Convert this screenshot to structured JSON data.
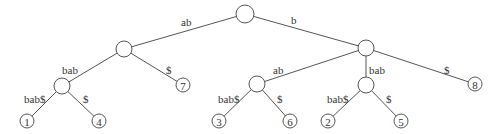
{
  "diagram": {
    "type": "suffix-tree",
    "colors": {
      "stroke": "#555555",
      "text": "#333333",
      "background": "#ffffff"
    },
    "nodes": [
      {
        "id": "root",
        "x": 245,
        "y": 14,
        "r": 9,
        "label": ""
      },
      {
        "id": "n_ab",
        "x": 124,
        "y": 49,
        "r": 8,
        "label": ""
      },
      {
        "id": "n_b",
        "x": 366,
        "y": 48,
        "r": 8,
        "label": ""
      },
      {
        "id": "n_abbab",
        "x": 62,
        "y": 86,
        "r": 8,
        "label": ""
      },
      {
        "id": "leaf7",
        "x": 183,
        "y": 85,
        "r": 7,
        "label": "7"
      },
      {
        "id": "n_bab",
        "x": 257,
        "y": 84,
        "r": 8,
        "label": ""
      },
      {
        "id": "n_bbab",
        "x": 366,
        "y": 85,
        "r": 8,
        "label": ""
      },
      {
        "id": "leaf8",
        "x": 475,
        "y": 84,
        "r": 7,
        "label": "8"
      },
      {
        "id": "leaf1",
        "x": 27,
        "y": 121,
        "r": 7,
        "label": "1"
      },
      {
        "id": "leaf4",
        "x": 99,
        "y": 121,
        "r": 7,
        "label": "4"
      },
      {
        "id": "leaf3",
        "x": 219,
        "y": 121,
        "r": 7,
        "label": "3"
      },
      {
        "id": "leaf6",
        "x": 290,
        "y": 121,
        "r": 7,
        "label": "6"
      },
      {
        "id": "leaf2",
        "x": 328,
        "y": 121,
        "r": 7,
        "label": "2"
      },
      {
        "id": "leaf5",
        "x": 401,
        "y": 121,
        "r": 7,
        "label": "5"
      }
    ],
    "edges": [
      {
        "from": "root",
        "to": "n_ab",
        "label": "ab",
        "lx": 181,
        "ly": 26
      },
      {
        "from": "root",
        "to": "n_b",
        "label": "b",
        "lx": 291,
        "ly": 24
      },
      {
        "from": "n_ab",
        "to": "n_abbab",
        "label": "bab",
        "lx": 62,
        "ly": 74
      },
      {
        "from": "n_ab",
        "to": "leaf7",
        "label": "$",
        "lx": 166,
        "ly": 74
      },
      {
        "from": "n_abbab",
        "to": "leaf1",
        "label": "bab$",
        "lx": 24,
        "ly": 103
      },
      {
        "from": "n_abbab",
        "to": "leaf4",
        "label": "$",
        "lx": 83,
        "ly": 103
      },
      {
        "from": "n_b",
        "to": "n_bab",
        "label": "ab",
        "lx": 273,
        "ly": 74
      },
      {
        "from": "n_b",
        "to": "n_bbab",
        "label": "bab",
        "lx": 369,
        "ly": 74
      },
      {
        "from": "n_b",
        "to": "leaf8",
        "label": "$",
        "lx": 444,
        "ly": 74
      },
      {
        "from": "n_bab",
        "to": "leaf3",
        "label": "bab$",
        "lx": 218,
        "ly": 103
      },
      {
        "from": "n_bab",
        "to": "leaf6",
        "label": "$",
        "lx": 277,
        "ly": 103
      },
      {
        "from": "n_bbab",
        "to": "leaf2",
        "label": "bab$",
        "lx": 327,
        "ly": 103
      },
      {
        "from": "n_bbab",
        "to": "leaf5",
        "label": "$",
        "lx": 386,
        "ly": 103
      }
    ]
  }
}
